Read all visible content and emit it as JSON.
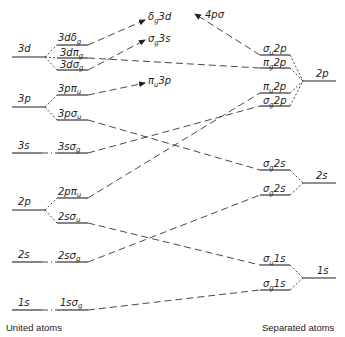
{
  "diagram": {
    "type": "molecular-orbital-correlation-diagram",
    "captions": {
      "left": "United atoms",
      "right": "Separated atoms"
    },
    "united_atom_levels": [
      {
        "label": "3d",
        "y": 57
      },
      {
        "label": "3p",
        "y": 107
      },
      {
        "label": "3s",
        "y": 153
      },
      {
        "label": "2p",
        "y": 210
      },
      {
        "label": "2s",
        "y": 262
      },
      {
        "label": "1s",
        "y": 310
      }
    ],
    "united_atom_orbitals": [
      {
        "main": "3d",
        "sym": "δ",
        "sub": "g",
        "y": 45
      },
      {
        "main": "3d",
        "sym": "π",
        "sub": "g",
        "y": 58
      },
      {
        "main": "3d",
        "sym": "σ",
        "sub": "g",
        "y": 70
      },
      {
        "main": "3p",
        "sym": "π",
        "sub": "u",
        "y": 95
      },
      {
        "main": "3p",
        "sym": "σ",
        "sub": "u",
        "y": 120
      },
      {
        "main": "3s",
        "sym": "σ",
        "sub": "g",
        "y": 153
      },
      {
        "main": "2p",
        "sym": "π",
        "sub": "u",
        "y": 198
      },
      {
        "main": "2s",
        "sym": "σ",
        "sub": "u",
        "y": 223
      },
      {
        "main": "2s",
        "sym": "σ",
        "sub": "g",
        "y": 262
      },
      {
        "main": "1s",
        "sym": "σ",
        "sub": "g",
        "y": 310
      }
    ],
    "separated_atom_levels": [
      {
        "label": "2p",
        "y": 81
      },
      {
        "label": "2s",
        "y": 183
      },
      {
        "label": "1s",
        "y": 278
      }
    ],
    "separated_atom_orbitals": [
      {
        "sym": "σ",
        "sub": "u",
        "main": "2p",
        "y": 55
      },
      {
        "sym": "π",
        "sub": "g",
        "main": "2p",
        "y": 68
      },
      {
        "sym": "π",
        "sub": "u",
        "main": "2p",
        "y": 93
      },
      {
        "sym": "σ",
        "sub": "g",
        "main": "2p",
        "y": 106
      },
      {
        "sym": "σ",
        "sub": "g",
        "main": "2s",
        "y": 170
      },
      {
        "sym": "σ",
        "sub": "g",
        "main": "2s",
        "y": 195
      },
      {
        "sym": "σ",
        "sub": "u",
        "main": "1s",
        "y": 265
      },
      {
        "sym": "σ",
        "sub": "g",
        "main": "1s",
        "y": 290
      }
    ],
    "arrow_targets": [
      {
        "sym": "δ",
        "sub": "g",
        "main": "3d"
      },
      {
        "sym": "σ",
        "sub": "g",
        "main": "3s"
      },
      {
        "sym": "π",
        "sub": "u",
        "main": "3p"
      },
      {
        "text": "4pσ"
      }
    ],
    "correlations": [
      {
        "from": "3dδg",
        "to": "δg3d (arrow)"
      },
      {
        "from": "3dπg",
        "to": "πg2p"
      },
      {
        "from": "3dσg",
        "to": "σg3s (arrow)"
      },
      {
        "from": "3pπu",
        "to": "πu3p (arrow)"
      },
      {
        "from": "3pσu",
        "to": "σg2s (upper)"
      },
      {
        "from": "3sσg",
        "to": "σg2p"
      },
      {
        "from": "2pπu",
        "to": "πu2p"
      },
      {
        "from": "2sσu",
        "to": "σu1s"
      },
      {
        "from": "2sσg",
        "to": "σg2s (lower)"
      },
      {
        "from": "1sσg",
        "to": "σg1s"
      },
      {
        "from": "σu2p",
        "to": "4pσ (arrow)"
      }
    ]
  }
}
